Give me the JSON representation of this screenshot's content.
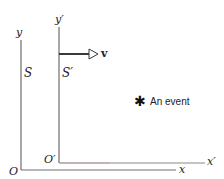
{
  "diagram": {
    "frame_S": {
      "label": "S",
      "y_axis_label": "y",
      "x_axis_label": "x",
      "origin_label": "O"
    },
    "frame_S_prime": {
      "label": "S′",
      "y_axis_label": "y′",
      "x_axis_label": "x′",
      "origin_label": "O′"
    },
    "velocity": {
      "label": "v"
    },
    "event": {
      "marker": "✱",
      "label": "An event"
    },
    "colors": {
      "axis": "#6e6e6e",
      "x_prime_axis": "#8a8a8a",
      "x_prime_axis_tint": "#b06060",
      "arrow": "#3a3a3a",
      "text": "#222222"
    }
  }
}
